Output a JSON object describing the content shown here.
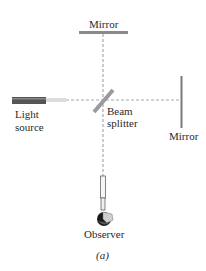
{
  "figure": {
    "type": "Michelson interferometer schematic",
    "labels": {
      "top_mirror": "Mirror",
      "right_mirror": "Mirror",
      "light_source_line1": "Light",
      "light_source_line2": "source",
      "beam_splitter_line1": "Beam",
      "beam_splitter_line2": "splitter",
      "observer": "Observer",
      "caption": "(a)"
    },
    "colors": {
      "mirror": "#8a8a8a",
      "beam": "#a8a8a8",
      "source": "#555555",
      "text": "#2a2a2a"
    }
  }
}
